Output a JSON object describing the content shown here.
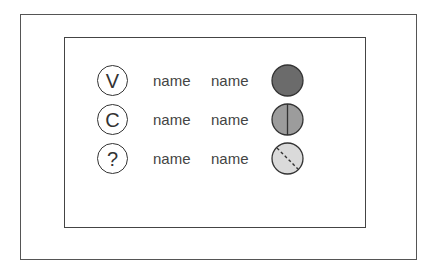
{
  "diagram": {
    "rows": [
      {
        "symbol": "V",
        "name1": "name",
        "name2": "name",
        "status": {
          "style": "solid",
          "fill": "#6b6b6b"
        }
      },
      {
        "symbol": "C",
        "name1": "name",
        "name2": "name",
        "status": {
          "style": "vertical-split",
          "fill": "#9c9c9c"
        }
      },
      {
        "symbol": "?",
        "name1": "name",
        "name2": "name",
        "status": {
          "style": "dashed-diagonal",
          "fill": "#dadada"
        }
      }
    ]
  }
}
